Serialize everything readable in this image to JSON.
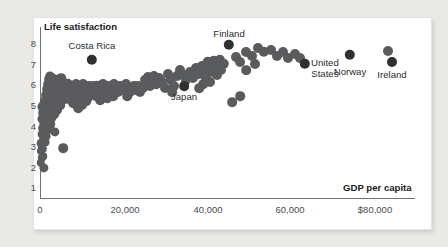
{
  "chart_data": {
    "type": "scatter",
    "title": "",
    "xlabel": "GDP per capita",
    "ylabel": "Life satisfaction",
    "xlim": [
      0,
      88000
    ],
    "ylim": [
      0.4,
      8.6
    ],
    "grid": false,
    "legend": null,
    "xticks": [
      {
        "value": 0,
        "label": "0",
        "px": 40
      },
      {
        "value": 20000,
        "label": "20,000",
        "px": 125
      },
      {
        "value": 40000,
        "label": "40,000",
        "px": 208
      },
      {
        "value": 60000,
        "label": "60,000",
        "px": 290
      },
      {
        "value": 80000,
        "label": "$80,000",
        "px": 375
      }
    ],
    "yticks": [
      {
        "value": 8,
        "label": "8",
        "px": 44
      },
      {
        "value": 7,
        "label": "7",
        "px": 64.5
      },
      {
        "value": 6,
        "label": "6",
        "px": 85
      },
      {
        "value": 5,
        "label": "5",
        "px": 106
      },
      {
        "value": 4,
        "label": "4",
        "px": 126.5
      },
      {
        "value": 3,
        "label": "3",
        "px": 147
      },
      {
        "value": 2,
        "label": "2",
        "px": 167.5
      },
      {
        "value": 1,
        "label": "1",
        "px": 188
      }
    ],
    "colors": {
      "point": "#5a5b5d",
      "highlight": "#2f3032",
      "axis": "#6f7173",
      "card": "#ffffff",
      "page_background": "#e9e9e7",
      "text": "#2b2c2e"
    },
    "annotations": [
      {
        "name": "Costa Rica",
        "x": 12400,
        "y": 7.05,
        "label_x": 92,
        "label_y": 41,
        "align": "center"
      },
      {
        "name": "Finland",
        "x": 44500,
        "y": 7.78,
        "label_x": 229,
        "label_y": 29,
        "align": "center"
      },
      {
        "name": "Japan",
        "x": 34000,
        "y": 5.92,
        "label_x": 184,
        "label_y": 92,
        "align": "center"
      },
      {
        "name": "United States",
        "x": 63500,
        "y": 6.92,
        "label_x": 311,
        "label_y": 58,
        "align": "left"
      },
      {
        "name": "Norway",
        "x": 74500,
        "y": 7.35,
        "label_x": 350,
        "label_y": 67,
        "align": "center"
      },
      {
        "name": "Ireland",
        "x": 84000,
        "y": 6.98,
        "label_x": 392,
        "label_y": 70,
        "align": "center"
      }
    ],
    "highlight_points": [
      {
        "name": "Costa Rica",
        "px": 92,
        "py": 60,
        "r": 5.2
      },
      {
        "name": "Finland",
        "px": 229,
        "py": 45,
        "r": 5.2
      },
      {
        "name": "Japan",
        "px": 184,
        "py": 86,
        "r": 4.8
      },
      {
        "name": "United States",
        "px": 305,
        "py": 64,
        "r": 5.2
      },
      {
        "name": "Norway",
        "px": 350,
        "py": 55,
        "r": 5.2
      },
      {
        "name": "Ireland",
        "px": 392,
        "py": 62,
        "r": 5.0
      }
    ],
    "points_px": [
      [
        41,
        151,
        4.0
      ],
      [
        42,
        147,
        4.2
      ],
      [
        43,
        156,
        3.8
      ],
      [
        41,
        143,
        4.4
      ],
      [
        44,
        138,
        4.6
      ],
      [
        42,
        134,
        4.4
      ],
      [
        45,
        131,
        4.6
      ],
      [
        43,
        128,
        4.8
      ],
      [
        46,
        126,
        4.4
      ],
      [
        44,
        122,
        4.8
      ],
      [
        42,
        119,
        4.6
      ],
      [
        47,
        120,
        4.4
      ],
      [
        45,
        116,
        5.0
      ],
      [
        43,
        113,
        4.8
      ],
      [
        48,
        114,
        4.4
      ],
      [
        46,
        110,
        5.2
      ],
      [
        44,
        107,
        6.5
      ],
      [
        49,
        108,
        4.6
      ],
      [
        47,
        104,
        5.0
      ],
      [
        45,
        101,
        4.8
      ],
      [
        50,
        102,
        4.4
      ],
      [
        48,
        98,
        5.0
      ],
      [
        46,
        95,
        4.8
      ],
      [
        51,
        96,
        4.6
      ],
      [
        49,
        92,
        5.0
      ],
      [
        47,
        89,
        4.8
      ],
      [
        52,
        90,
        4.6
      ],
      [
        50,
        87,
        5.2
      ],
      [
        48,
        84,
        4.8
      ],
      [
        53,
        86,
        4.6
      ],
      [
        51,
        82,
        5.0
      ],
      [
        49,
        79,
        4.8
      ],
      [
        54,
        81,
        4.8
      ],
      [
        52,
        78,
        5.0
      ],
      [
        50,
        76,
        4.6
      ],
      [
        56,
        84,
        5.0
      ],
      [
        58,
        88,
        5.2
      ],
      [
        55,
        92,
        5.0
      ],
      [
        57,
        95,
        4.8
      ],
      [
        59,
        99,
        5.0
      ],
      [
        56,
        103,
        4.8
      ],
      [
        60,
        92,
        5.0
      ],
      [
        62,
        86,
        5.0
      ],
      [
        58,
        80,
        5.2
      ],
      [
        61,
        78,
        4.8
      ],
      [
        63,
        82,
        5.0
      ],
      [
        65,
        88,
        5.2
      ],
      [
        62,
        95,
        5.0
      ],
      [
        64,
        99,
        4.8
      ],
      [
        66,
        94,
        5.0
      ],
      [
        60,
        105,
        4.8
      ],
      [
        57,
        110,
        5.0
      ],
      [
        54,
        114,
        4.8
      ],
      [
        52,
        118,
        4.6
      ],
      [
        50,
        124,
        4.8
      ],
      [
        48,
        130,
        4.6
      ],
      [
        46,
        136,
        4.4
      ],
      [
        45,
        142,
        4.4
      ],
      [
        43,
        149,
        4.2
      ],
      [
        42,
        158,
        4.2
      ],
      [
        41,
        163,
        4.2
      ],
      [
        44,
        168,
        4.6
      ],
      [
        55,
        132,
        4.6
      ],
      [
        63,
        148,
        4.8
      ],
      [
        68,
        84,
        5.2
      ],
      [
        70,
        90,
        5.0
      ],
      [
        72,
        86,
        5.0
      ],
      [
        74,
        92,
        5.2
      ],
      [
        69,
        97,
        4.8
      ],
      [
        71,
        100,
        4.8
      ],
      [
        75,
        97,
        5.0
      ],
      [
        73,
        103,
        4.8
      ],
      [
        77,
        91,
        5.0
      ],
      [
        79,
        86,
        5.0
      ],
      [
        76,
        84,
        5.0
      ],
      [
        81,
        88,
        5.2
      ],
      [
        83,
        84,
        5.0
      ],
      [
        85,
        88,
        5.0
      ],
      [
        87,
        92,
        5.0
      ],
      [
        84,
        96,
        4.8
      ],
      [
        89,
        86,
        5.0
      ],
      [
        91,
        91,
        5.0
      ],
      [
        78,
        108,
        4.8
      ],
      [
        82,
        105,
        5.0
      ],
      [
        86,
        101,
        4.8
      ],
      [
        80,
        100,
        4.8
      ],
      [
        88,
        97,
        4.8
      ],
      [
        93,
        86,
        5.0
      ],
      [
        95,
        90,
        5.0
      ],
      [
        97,
        86,
        5.2
      ],
      [
        99,
        92,
        5.0
      ],
      [
        96,
        96,
        4.8
      ],
      [
        101,
        88,
        5.0
      ],
      [
        103,
        84,
        5.0
      ],
      [
        100,
        100,
        4.8
      ],
      [
        104,
        95,
        4.8
      ],
      [
        106,
        90,
        5.0
      ],
      [
        108,
        86,
        5.0
      ],
      [
        110,
        92,
        5.0
      ],
      [
        107,
        98,
        4.8
      ],
      [
        112,
        88,
        5.0
      ],
      [
        114,
        84,
        5.0
      ],
      [
        116,
        88,
        5.0
      ],
      [
        118,
        92,
        5.0
      ],
      [
        113,
        96,
        4.8
      ],
      [
        120,
        86,
        5.0
      ],
      [
        122,
        90,
        5.0
      ],
      [
        124,
        88,
        5.2
      ],
      [
        126,
        84,
        5.0
      ],
      [
        128,
        88,
        5.0
      ],
      [
        130,
        92,
        5.0
      ],
      [
        127,
        96,
        4.8
      ],
      [
        132,
        88,
        5.0
      ],
      [
        134,
        86,
        5.0
      ],
      [
        136,
        90,
        5.0
      ],
      [
        138,
        86,
        5.0
      ],
      [
        140,
        92,
        5.0
      ],
      [
        143,
        88,
        5.0
      ],
      [
        145,
        80,
        5.0
      ],
      [
        148,
        77,
        5.0
      ],
      [
        151,
        80,
        5.0
      ],
      [
        154,
        76,
        5.0
      ],
      [
        150,
        86,
        5.0
      ],
      [
        156,
        84,
        4.8
      ],
      [
        159,
        78,
        5.0
      ],
      [
        162,
        82,
        5.0
      ],
      [
        165,
        88,
        5.0
      ],
      [
        168,
        74,
        5.0
      ],
      [
        171,
        80,
        5.0
      ],
      [
        174,
        86,
        5.0
      ],
      [
        177,
        76,
        5.0
      ],
      [
        172,
        92,
        4.8
      ],
      [
        180,
        70,
        5.0
      ],
      [
        183,
        75,
        5.0
      ],
      [
        186,
        80,
        5.0
      ],
      [
        190,
        72,
        5.0
      ],
      [
        193,
        78,
        5.0
      ],
      [
        196,
        68,
        5.0
      ],
      [
        199,
        74,
        5.0
      ],
      [
        202,
        66,
        5.0
      ],
      [
        205,
        71,
        5.0
      ],
      [
        208,
        62,
        5.2
      ],
      [
        211,
        67,
        5.2
      ],
      [
        214,
        61,
        5.2
      ],
      [
        217,
        66,
        5.2
      ],
      [
        220,
        60,
        5.2
      ],
      [
        213,
        72,
        5.0
      ],
      [
        217,
        75,
        5.0
      ],
      [
        221,
        70,
        5.0
      ],
      [
        224,
        64,
        5.2
      ],
      [
        206,
        78,
        5.0
      ],
      [
        210,
        82,
        5.0
      ],
      [
        203,
        84,
        4.8
      ],
      [
        199,
        88,
        4.8
      ],
      [
        236,
        57,
        5.0
      ],
      [
        240,
        62,
        5.0
      ],
      [
        246,
        52,
        5.0
      ],
      [
        252,
        56,
        5.0
      ],
      [
        258,
        48,
        5.0
      ],
      [
        264,
        52,
        5.2
      ],
      [
        271,
        50,
        5.0
      ],
      [
        277,
        56,
        5.0
      ],
      [
        283,
        52,
        5.0
      ],
      [
        288,
        58,
        5.0
      ],
      [
        295,
        54,
        5.0
      ],
      [
        300,
        58,
        5.0
      ],
      [
        232,
        102,
        4.8
      ],
      [
        240,
        96,
        4.8
      ],
      [
        388,
        51,
        5.0
      ],
      [
        246,
        70,
        4.8
      ],
      [
        255,
        64,
        5.0
      ]
    ]
  },
  "card": {
    "border_color": "#e2e2de"
  }
}
